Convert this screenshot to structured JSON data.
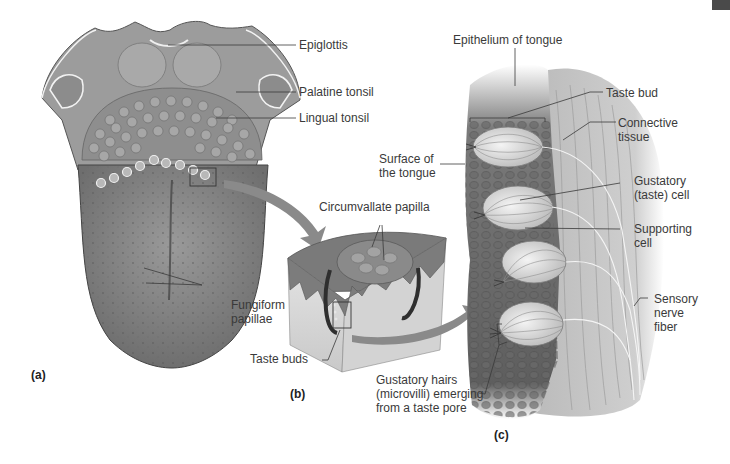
{
  "figure": {
    "panels": {
      "a": {
        "tag": "(a)"
      },
      "b": {
        "tag": "(b)"
      },
      "c": {
        "tag": "(c)"
      }
    },
    "labels": {
      "epiglottis": "Epiglottis",
      "palatine_tonsil": "Palatine tonsil",
      "lingual_tonsil": "Lingual tonsil",
      "fungiform_papillae": "Fungiform\npapillae",
      "circumvallate_papilla": "Circumvallate papilla",
      "taste_buds": "Taste buds",
      "epithelium_of_tongue": "Epithelium of tongue",
      "taste_bud": "Taste bud",
      "connective_tissue": "Connective\ntissue",
      "surface_of_the_tongue": "Surface of\nthe tongue",
      "gustatory_cell": "Gustatory\n(taste) cell",
      "supporting_cell": "Supporting\ncell",
      "sensory_nerve_fiber": "Sensory\nnerve\nfiber",
      "gustatory_hairs": "Gustatory hairs\n(microvilli) emerging\nfrom a taste pore"
    },
    "colors": {
      "tissue_dark": "#6b6b6b",
      "tissue_mid": "#8d8d8d",
      "tissue_light": "#bdbdbd",
      "arrow": "#8a8a8a",
      "leader_line": "#333333",
      "corner_tab": "#4a4a4a"
    }
  }
}
